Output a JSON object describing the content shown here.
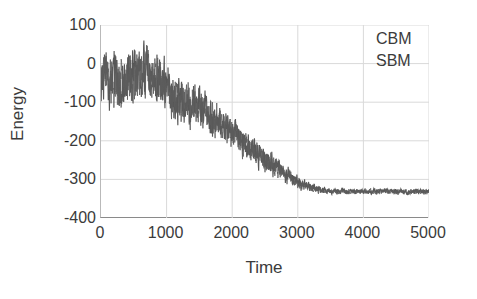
{
  "chart_data": {
    "type": "line",
    "title": "",
    "xlabel": "Time",
    "ylabel": "Energy",
    "xlim": [
      0,
      5000
    ],
    "ylim": [
      -400,
      100
    ],
    "xticks": [
      0,
      1000,
      2000,
      3000,
      4000,
      5000
    ],
    "yticks": [
      100,
      0,
      -100,
      -200,
      -300,
      -400
    ],
    "xtick_labels": [
      "0",
      "1000",
      "2000",
      "3000",
      "4000",
      "5000"
    ],
    "ytick_labels": [
      "100",
      "0",
      "-100",
      "-200",
      "-300",
      "-400"
    ],
    "grid": true,
    "legend_position": "top-right",
    "series": [
      {
        "name": "CBM",
        "color": "#4a4a4a",
        "x": [
          0,
          100,
          200,
          300,
          400,
          500,
          600,
          700,
          800,
          900,
          1000,
          1100,
          1200,
          1300,
          1400,
          1500,
          1600,
          1700,
          1800,
          1900,
          2000,
          2100,
          2200,
          2300,
          2400,
          2500,
          2600,
          2700,
          2800,
          2900,
          3000,
          3100,
          3200,
          3300,
          3400,
          3500,
          3600,
          3700,
          3800,
          3900,
          4000,
          4100,
          4200,
          4300,
          4400,
          4500,
          4600,
          4700,
          4800,
          4900,
          5000
        ],
        "values": [
          -30,
          -40,
          -35,
          -55,
          -45,
          -30,
          -20,
          -15,
          -40,
          -55,
          -60,
          -80,
          -95,
          -100,
          -110,
          -105,
          -130,
          -145,
          -150,
          -165,
          -175,
          -195,
          -205,
          -225,
          -240,
          -250,
          -260,
          -270,
          -285,
          -295,
          -305,
          -315,
          -320,
          -325,
          -328,
          -330,
          -330,
          -331,
          -332,
          -330,
          -331,
          -332,
          -331,
          -330,
          -332,
          -331,
          -332,
          -331,
          -330,
          -332,
          -331
        ],
        "noise_amplitude": [
          60,
          62,
          60,
          58,
          60,
          62,
          64,
          60,
          58,
          56,
          55,
          52,
          50,
          50,
          48,
          46,
          45,
          42,
          40,
          38,
          36,
          34,
          32,
          30,
          28,
          26,
          24,
          22,
          20,
          18,
          16,
          13,
          11,
          9,
          8,
          7,
          6,
          6,
          6,
          6,
          6,
          6,
          6,
          6,
          6,
          6,
          6,
          6,
          6,
          6,
          6
        ]
      },
      {
        "name": "SBM",
        "color": "#5c5c5c",
        "x": [
          0,
          100,
          200,
          300,
          400,
          500,
          600,
          700,
          800,
          900,
          1000,
          1100,
          1200,
          1300,
          1400,
          1500,
          1600,
          1700,
          1800,
          1900,
          2000,
          2100,
          2200,
          2300,
          2400,
          2500,
          2600,
          2700,
          2800,
          2900,
          3000,
          3100,
          3200,
          3300,
          3400,
          3500,
          3600,
          3700,
          3800,
          3900,
          4000,
          4100,
          4200,
          4300,
          4400,
          4500,
          4600,
          4700,
          4800,
          4900,
          5000
        ],
        "values": [
          -28,
          -42,
          -38,
          -50,
          -48,
          -34,
          -25,
          -18,
          -44,
          -58,
          -62,
          -78,
          -92,
          -104,
          -108,
          -108,
          -128,
          -148,
          -154,
          -162,
          -178,
          -192,
          -208,
          -222,
          -238,
          -252,
          -262,
          -272,
          -282,
          -298,
          -308,
          -316,
          -322,
          -326,
          -329,
          -331,
          -332,
          -330,
          -333,
          -332,
          -333,
          -331,
          -333,
          -332,
          -331,
          -333,
          -331,
          -333,
          -332,
          -331,
          -333
        ],
        "noise_amplitude": [
          58,
          60,
          62,
          60,
          58,
          60,
          62,
          62,
          56,
          54,
          53,
          50,
          49,
          48,
          46,
          45,
          43,
          41,
          39,
          37,
          35,
          33,
          31,
          29,
          27,
          25,
          23,
          21,
          19,
          17,
          15,
          12,
          10,
          9,
          7,
          7,
          6,
          6,
          6,
          6,
          6,
          6,
          6,
          6,
          6,
          6,
          6,
          6,
          6,
          6,
          6
        ]
      }
    ],
    "colors": {
      "axis": "#8a8a8a",
      "grid": "#d9d9d9",
      "text": "#3b3b3b",
      "background": "#ffffff"
    }
  },
  "legend": {
    "entries": [
      {
        "label": "CBM"
      },
      {
        "label": "SBM"
      }
    ]
  }
}
